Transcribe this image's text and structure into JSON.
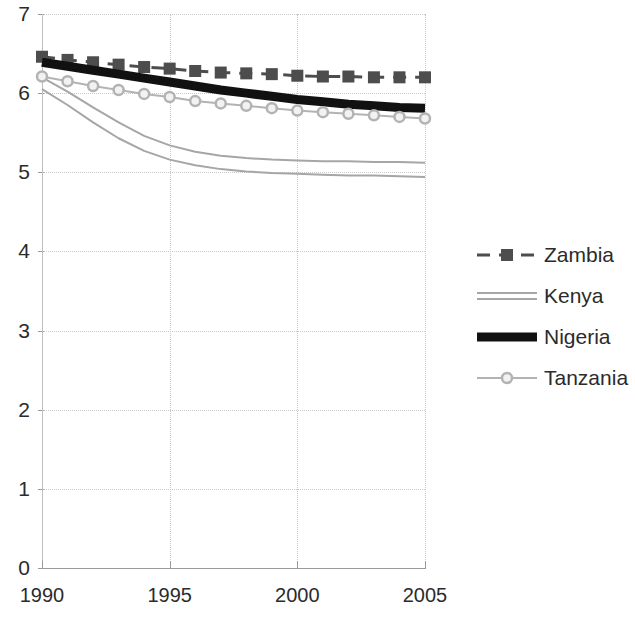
{
  "chart_data": {
    "type": "line",
    "title": "",
    "subtitle": "",
    "xlabel": "",
    "ylabel": "",
    "xlim": [
      1990,
      2005
    ],
    "ylim": [
      0,
      7
    ],
    "grid": true,
    "legend_position": "right",
    "x_ticks": [
      "1990",
      "1995",
      "2000",
      "2005"
    ],
    "x_tick_values": [
      1990,
      1995,
      2000,
      2005
    ],
    "y_ticks": [
      "0",
      "1",
      "2",
      "3",
      "4",
      "5",
      "6",
      "7"
    ],
    "y_tick_values": [
      0,
      1,
      2,
      3,
      4,
      5,
      6,
      7
    ],
    "x": [
      1990,
      1991,
      1992,
      1993,
      1994,
      1995,
      1996,
      1997,
      1998,
      1999,
      2000,
      2001,
      2002,
      2003,
      2004,
      2005
    ],
    "series": [
      {
        "name": "Zambia",
        "color": "#4d4d4d",
        "style": "dashed",
        "marker": "square",
        "width": 3,
        "values": [
          6.46,
          6.42,
          6.39,
          6.36,
          6.33,
          6.31,
          6.28,
          6.26,
          6.25,
          6.24,
          6.22,
          6.21,
          6.21,
          6.2,
          6.2,
          6.2
        ]
      },
      {
        "name": "Kenya",
        "color": "#a6a6a6",
        "style": "solid-double",
        "marker": "none",
        "width": 2,
        "values": [
          6.2,
          6.02,
          5.82,
          5.63,
          5.46,
          5.34,
          5.26,
          5.21,
          5.18,
          5.16,
          5.15,
          5.14,
          5.14,
          5.13,
          5.13,
          5.12
        ],
        "values_second": [
          6.05,
          5.85,
          5.63,
          5.43,
          5.27,
          5.16,
          5.09,
          5.04,
          5.01,
          4.99,
          4.98,
          4.97,
          4.96,
          4.96,
          4.95,
          4.94
        ]
      },
      {
        "name": "Nigeria",
        "color": "#111111",
        "style": "solid-thick",
        "marker": "none",
        "width": 9,
        "values": [
          6.39,
          6.34,
          6.29,
          6.24,
          6.19,
          6.14,
          6.09,
          6.04,
          6.0,
          5.96,
          5.92,
          5.89,
          5.86,
          5.84,
          5.82,
          5.81
        ]
      },
      {
        "name": "Tanzania",
        "color": "#b3b3b3",
        "style": "solid",
        "marker": "circle",
        "width": 2,
        "values": [
          6.21,
          6.15,
          6.09,
          6.04,
          5.99,
          5.95,
          5.9,
          5.87,
          5.84,
          5.81,
          5.78,
          5.76,
          5.74,
          5.72,
          5.7,
          5.68
        ]
      }
    ]
  },
  "legend": {
    "items": [
      {
        "label": "Zambia"
      },
      {
        "label": "Kenya"
      },
      {
        "label": "Nigeria"
      },
      {
        "label": "Tanzania"
      }
    ]
  },
  "axes": {
    "y_labels": [
      "7",
      "6",
      "5",
      "4",
      "3",
      "2",
      "1",
      "0"
    ],
    "x_labels": [
      "1990",
      "1995",
      "2000",
      "2005"
    ]
  }
}
